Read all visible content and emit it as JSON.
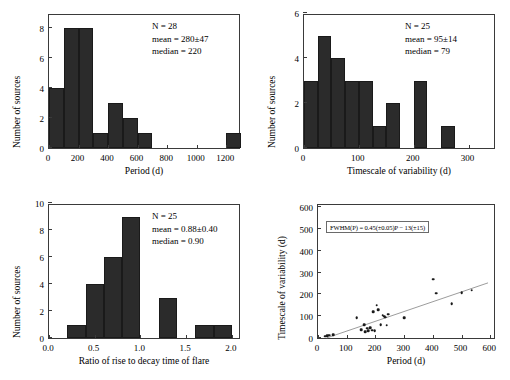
{
  "chart_data": [
    {
      "id": "period-histogram",
      "type": "bar",
      "title": "",
      "xlabel": "Period (d)",
      "ylabel": "Number of sources",
      "xlim": [
        0,
        1300
      ],
      "ylim": [
        0,
        9
      ],
      "xticks": [
        0,
        200,
        400,
        600,
        800,
        1000,
        1200
      ],
      "yticks": [
        0,
        2,
        4,
        6,
        8
      ],
      "bin_width": 100,
      "bin_starts": [
        0,
        100,
        200,
        300,
        400,
        500,
        600,
        1200
      ],
      "values": [
        4,
        8,
        8,
        1,
        3,
        2,
        1,
        1
      ],
      "grid": false,
      "annotations": {
        "n": "N = 28",
        "mean": "mean = 280±47",
        "median": "median = 220"
      }
    },
    {
      "id": "timescale-histogram",
      "type": "bar",
      "title": "",
      "xlabel": "Timescale of variability (d)",
      "ylabel": "Number of sources",
      "xlim": [
        0,
        350
      ],
      "ylim": [
        0,
        6
      ],
      "xticks": [
        0,
        100,
        200,
        300
      ],
      "yticks": [
        0,
        2,
        4,
        6
      ],
      "bin_width": 25,
      "bin_starts": [
        0,
        25,
        50,
        75,
        100,
        125,
        150,
        200,
        250
      ],
      "values": [
        3,
        5,
        4,
        3,
        3,
        1,
        2,
        3,
        1
      ],
      "grid": false,
      "annotations": {
        "n": "N = 25",
        "mean": "mean = 95±14",
        "median": "median = 79"
      }
    },
    {
      "id": "ratio-histogram",
      "type": "bar",
      "title": "",
      "xlabel": "Ratio of rise to decay time of flare",
      "ylabel": "Number of sources",
      "xlim": [
        0.0,
        2.1
      ],
      "ylim": [
        0,
        10
      ],
      "xticks": [
        0.0,
        0.5,
        1.0,
        1.5,
        2.0
      ],
      "xticklabels": [
        "0.0",
        "0.5",
        "1.0",
        "1.5",
        "2.0"
      ],
      "yticks": [
        0,
        2,
        4,
        6,
        8,
        10
      ],
      "bin_width": 0.2,
      "bin_starts": [
        0.2,
        0.4,
        0.6,
        0.8,
        1.2,
        1.6,
        1.8
      ],
      "values": [
        1,
        4,
        6,
        9,
        3,
        1,
        1
      ],
      "grid": false,
      "annotations": {
        "n": "N = 25",
        "mean": "mean = 0.88±0.40",
        "median": "median = 0.90"
      }
    },
    {
      "id": "period-vs-timescale-scatter",
      "type": "scatter",
      "title": "",
      "xlabel": "Period (d)",
      "ylabel": "Timescale of variability (d)",
      "xlim": [
        0,
        620
      ],
      "ylim": [
        0,
        620
      ],
      "xticks": [
        0,
        100,
        200,
        300,
        400,
        500,
        600
      ],
      "yticks": [
        0,
        100,
        200,
        300,
        400,
        500,
        600
      ],
      "grid": false,
      "annotation_equation": "FWHM(P) = 0.45(±0.05)P − 13(±15)",
      "fit": {
        "slope": 0.45,
        "intercept": -13,
        "x_start": 30,
        "x_end": 600
      },
      "points": [
        {
          "x": 25,
          "y": 8
        },
        {
          "x": 32,
          "y": 10
        },
        {
          "x": 40,
          "y": 12
        },
        {
          "x": 52,
          "y": 15
        },
        {
          "x": 135,
          "y": 92
        },
        {
          "x": 150,
          "y": 38
        },
        {
          "x": 160,
          "y": 60
        },
        {
          "x": 165,
          "y": 28
        },
        {
          "x": 172,
          "y": 45
        },
        {
          "x": 175,
          "y": 32
        },
        {
          "x": 182,
          "y": 48
        },
        {
          "x": 188,
          "y": 35
        },
        {
          "x": 192,
          "y": 120
        },
        {
          "x": 198,
          "y": 33
        },
        {
          "x": 205,
          "y": 150
        },
        {
          "x": 210,
          "y": 130
        },
        {
          "x": 218,
          "y": 60
        },
        {
          "x": 225,
          "y": 105
        },
        {
          "x": 230,
          "y": 100
        },
        {
          "x": 235,
          "y": 95
        },
        {
          "x": 240,
          "y": 58
        },
        {
          "x": 245,
          "y": 108
        },
        {
          "x": 300,
          "y": 92
        },
        {
          "x": 402,
          "y": 270
        },
        {
          "x": 412,
          "y": 205
        },
        {
          "x": 465,
          "y": 158
        },
        {
          "x": 500,
          "y": 208
        },
        {
          "x": 535,
          "y": 220
        }
      ]
    }
  ]
}
